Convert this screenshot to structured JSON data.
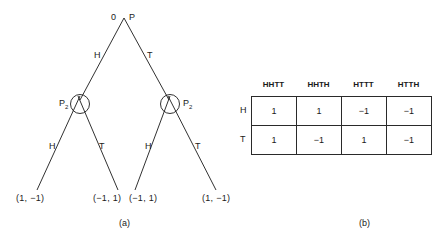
{
  "figure_a": {
    "caption": "(a)",
    "root": {
      "label": "P",
      "number": "0"
    },
    "root_edges": {
      "left": "H",
      "right": "T"
    },
    "info_set_nodes": [
      {
        "player": "P",
        "subscript": "2",
        "edges": {
          "left": "H",
          "right": "T"
        }
      },
      {
        "player": "P",
        "subscript": "2",
        "edges": {
          "left": "H",
          "right": "T"
        }
      }
    ],
    "payoffs": [
      "(1, −1)",
      "(−1, 1)",
      "(−1, 1)",
      "(1, −1)"
    ]
  },
  "figure_b": {
    "caption": "(b)",
    "columns": [
      "HHTT",
      "HHTH",
      "HTTT",
      "HTTH"
    ],
    "rows": [
      {
        "label": "H",
        "cells": [
          "1",
          "1",
          "−1",
          "−1"
        ]
      },
      {
        "label": "T",
        "cells": [
          "1",
          "−1",
          "1",
          "−1"
        ]
      }
    ]
  },
  "colors": {
    "ink": "#1a1a1a",
    "background": "#ffffff"
  }
}
